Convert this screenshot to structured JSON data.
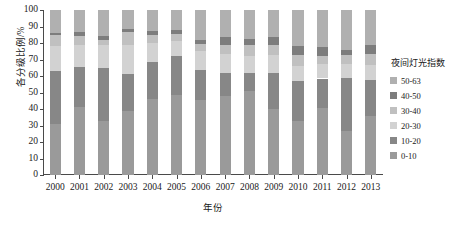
{
  "chart_data": {
    "type": "bar",
    "subtype": "stacked-percentage-column",
    "title": "",
    "xlabel": "年份",
    "ylabel": "各分级比例/%",
    "grid": false,
    "legend_position": "right",
    "legend_title": "夜间灯光指数",
    "ylim": [
      0,
      100
    ],
    "yticks": [
      0,
      10,
      20,
      30,
      40,
      50,
      60,
      70,
      80,
      90,
      100
    ],
    "ytick_labels": [
      "0",
      "10",
      "20",
      "30",
      "40",
      "50",
      "60",
      "70",
      "80",
      "90",
      "100"
    ],
    "categories": [
      "2000",
      "2001",
      "2002",
      "2003",
      "2004",
      "2005",
      "2006",
      "2007",
      "2008",
      "2009",
      "2010",
      "2011",
      "2012",
      "2013"
    ],
    "series": [
      {
        "name": "0-10",
        "color": "#9a9a9a",
        "values": [
          31.0,
          41.0,
          33.0,
          39.0,
          46.0,
          48.5,
          45.5,
          48.0,
          51.0,
          40.0,
          33.0,
          40.5,
          26.5,
          36.0
        ]
      },
      {
        "name": "10-20",
        "color": "#878787",
        "values": [
          32.0,
          24.5,
          32.0,
          22.5,
          22.5,
          23.5,
          18.0,
          14.0,
          11.0,
          22.0,
          24.0,
          18.0,
          32.0,
          21.5
        ]
      },
      {
        "name": "20-30",
        "color": "#d2d2d2",
        "values": [
          15.0,
          13.5,
          14.0,
          17.5,
          11.5,
          9.0,
          11.5,
          11.5,
          10.0,
          10.5,
          9.0,
          8.5,
          8.5,
          9.0
        ]
      },
      {
        "name": "30-40",
        "color": "#c0c0c0",
        "values": [
          7.0,
          5.5,
          3.0,
          7.5,
          5.0,
          4.5,
          4.5,
          5.5,
          7.0,
          6.5,
          7.0,
          5.0,
          5.5,
          7.0
        ]
      },
      {
        "name": "40-50",
        "color": "#7d7d7d",
        "values": [
          1.0,
          2.0,
          2.5,
          2.0,
          2.0,
          2.5,
          2.5,
          4.5,
          3.5,
          4.5,
          5.0,
          5.5,
          3.5,
          5.0
        ]
      },
      {
        "name": "50-63",
        "color": "#b0b0b0",
        "values": [
          14.0,
          13.5,
          15.5,
          11.5,
          13.0,
          12.0,
          18.0,
          16.5,
          17.5,
          16.5,
          22.0,
          22.5,
          24.0,
          21.5
        ]
      }
    ],
    "legend_entries": [
      {
        "label": "50-63",
        "color": "#b0b0b0"
      },
      {
        "label": "40-50",
        "color": "#7d7d7d"
      },
      {
        "label": "30-40",
        "color": "#c0c0c0"
      },
      {
        "label": "20-30",
        "color": "#d2d2d2"
      },
      {
        "label": "10-20",
        "color": "#878787"
      },
      {
        "label": "0-10",
        "color": "#9a9a9a"
      }
    ]
  }
}
